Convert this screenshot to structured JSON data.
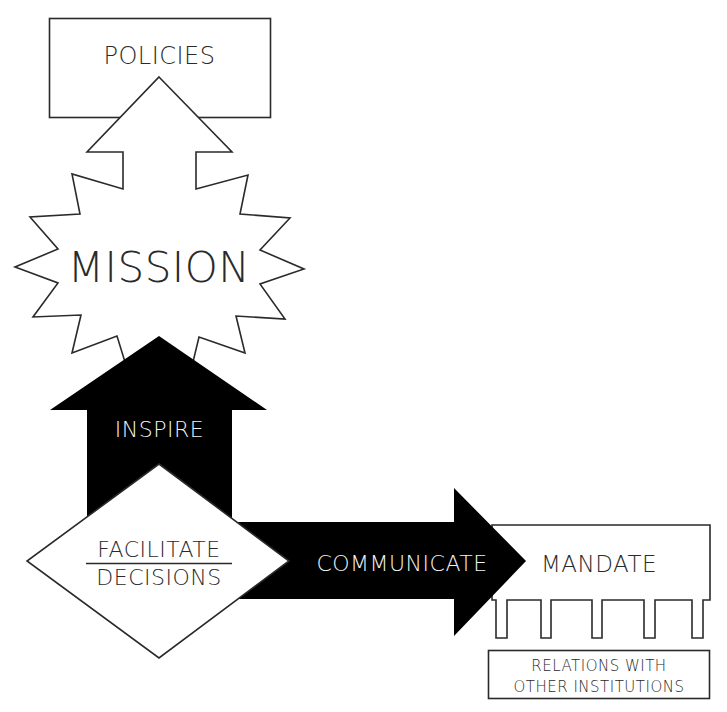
{
  "diagram": {
    "policies": {
      "label": "POLICIES"
    },
    "mission": {
      "label": "MISSION"
    },
    "inspire": {
      "label": "INSPIRE"
    },
    "facilitate": {
      "line1": "FACILITATE",
      "line2": "DECISIONS"
    },
    "communicate": {
      "label": "COMMUNICATE"
    },
    "mandate": {
      "label": "MANDATE"
    },
    "relations": {
      "line1": "RELATIONS WITH",
      "line2": "OTHER INSTITUTIONS"
    }
  },
  "colors": {
    "ink": "#000000",
    "stroke": "#2a2a2a",
    "background": "#ffffff",
    "inverse_text": "#f2f2f2"
  }
}
